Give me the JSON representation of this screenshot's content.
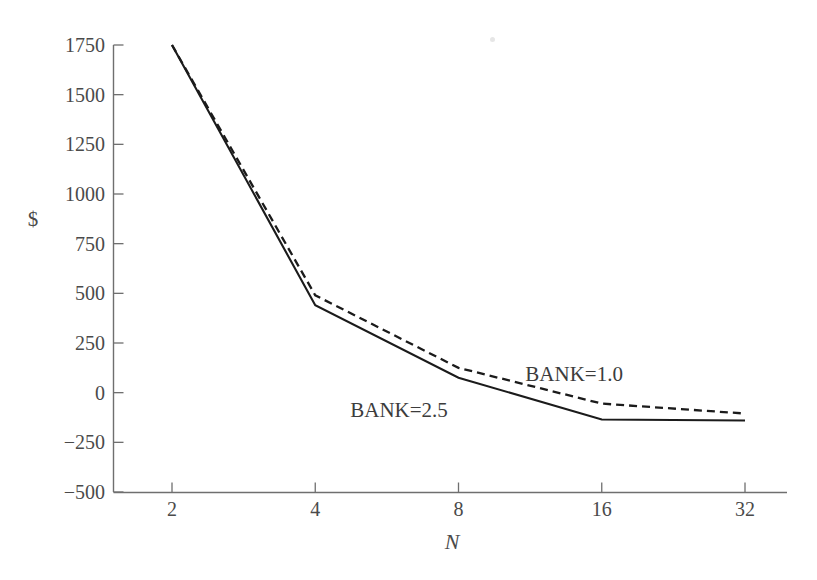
{
  "figure": {
    "background_color": "#ffffff",
    "ink_color": "#1b1b1b",
    "axis_color": "#6f6f6f"
  },
  "chart_data": {
    "type": "line",
    "title": "",
    "subtitle": "",
    "xlabel": "N",
    "ylabel": "$",
    "x": [
      2,
      4,
      8,
      16,
      32
    ],
    "x_tick_labels": [
      "2",
      "4",
      "8",
      "16",
      "32"
    ],
    "x_scale": "log2",
    "xlim": [
      2,
      32
    ],
    "ylim": [
      -500,
      1750
    ],
    "y_tick_labels": [
      "-500",
      "-250",
      "0",
      "250",
      "500",
      "750",
      "1000",
      "1250",
      "1500",
      "1750"
    ],
    "y_ticks": [
      -500,
      -250,
      0,
      250,
      500,
      750,
      1000,
      1250,
      1500,
      1750
    ],
    "grid": false,
    "legend_position": "inline-annotation",
    "series": [
      {
        "name": "BANK=2.5",
        "style": "solid",
        "label": "BANK=2.5",
        "values": [
          1750,
          440,
          75,
          -135,
          -140
        ]
      },
      {
        "name": "BANK=1.0",
        "style": "dashed",
        "label": "BANK=1.0",
        "values": [
          1750,
          490,
          125,
          -55,
          -105
        ]
      }
    ],
    "annotations": [
      {
        "text": "BANK=2.5",
        "x": 6.0,
        "y": -120
      },
      {
        "text": "BANK=1.0",
        "x": 14.0,
        "y": 60
      }
    ]
  }
}
